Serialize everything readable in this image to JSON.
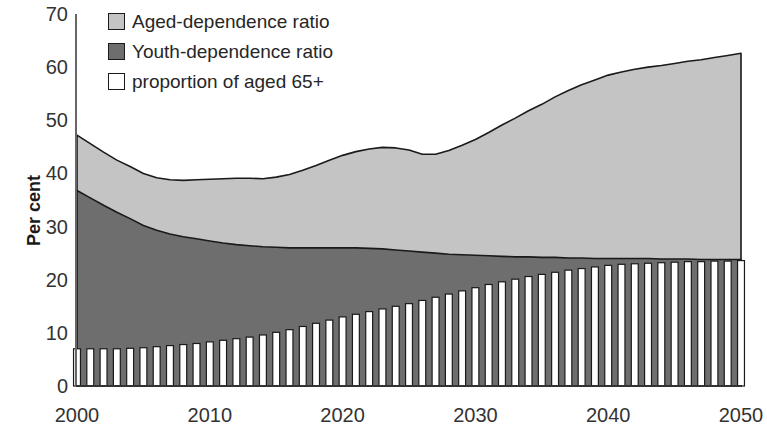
{
  "chart_data": {
    "type": "area",
    "title": "",
    "xlabel": "",
    "ylabel": "Per cent",
    "xlim": [
      2000,
      2050
    ],
    "ylim": [
      0,
      70
    ],
    "yticks": [
      70,
      60,
      50,
      40,
      30,
      20,
      10,
      0
    ],
    "xticks": [
      2000,
      2010,
      2020,
      2030,
      2040,
      2050
    ],
    "grid": false,
    "legend_position": "top-left",
    "stacked": true,
    "colors": {
      "aged_dependence": "#c4c4c4",
      "youth_dependence": "#6e6e6e",
      "proportion_aged_65plus": "#ffffff",
      "outline": "#1a1a1a",
      "axis": "#555555"
    },
    "x": [
      2000,
      2001,
      2002,
      2003,
      2004,
      2005,
      2006,
      2007,
      2008,
      2009,
      2010,
      2011,
      2012,
      2013,
      2014,
      2015,
      2016,
      2017,
      2018,
      2019,
      2020,
      2021,
      2022,
      2023,
      2024,
      2025,
      2026,
      2027,
      2028,
      2029,
      2030,
      2031,
      2032,
      2033,
      2034,
      2035,
      2036,
      2037,
      2038,
      2039,
      2040,
      2041,
      2042,
      2043,
      2044,
      2045,
      2046,
      2047,
      2048,
      2049,
      2050
    ],
    "series": [
      {
        "name": "Youth-dependence ratio",
        "values": [
          36.8,
          35.4,
          34.0,
          32.7,
          31.5,
          30.2,
          29.3,
          28.6,
          28.1,
          27.7,
          27.3,
          26.9,
          26.6,
          26.4,
          26.2,
          26.1,
          26.0,
          26.0,
          26.0,
          26.0,
          26.0,
          26.0,
          25.9,
          25.8,
          25.6,
          25.4,
          25.2,
          25.0,
          24.8,
          24.7,
          24.6,
          24.5,
          24.4,
          24.3,
          24.3,
          24.2,
          24.2,
          24.1,
          24.1,
          24.0,
          24.0,
          24.0,
          24.0,
          24.0,
          23.9,
          23.9,
          23.9,
          23.8,
          23.8,
          23.8,
          23.8
        ]
      },
      {
        "name": "Aged-dependence ratio",
        "values": [
          10.4,
          10.2,
          10.0,
          9.8,
          9.8,
          9.8,
          9.9,
          10.2,
          10.6,
          11.1,
          11.6,
          12.1,
          12.5,
          12.7,
          12.8,
          13.2,
          13.8,
          14.6,
          15.5,
          16.5,
          17.4,
          18.1,
          18.7,
          19.1,
          19.2,
          19.0,
          18.4,
          18.6,
          19.5,
          20.6,
          21.8,
          23.2,
          24.7,
          26.1,
          27.5,
          28.8,
          30.2,
          31.5,
          32.6,
          33.6,
          34.5,
          35.1,
          35.6,
          36.0,
          36.4,
          36.8,
          37.2,
          37.6,
          38.0,
          38.4,
          38.8
        ]
      }
    ],
    "total_dependence_ratio": [
      47.2,
      45.6,
      44.0,
      42.5,
      41.3,
      40.0,
      39.2,
      38.8,
      38.7,
      38.8,
      38.9,
      39.0,
      39.1,
      39.1,
      39.0,
      39.3,
      39.8,
      40.6,
      41.5,
      42.5,
      43.4,
      44.1,
      44.6,
      44.9,
      44.8,
      44.4,
      43.6,
      43.6,
      44.3,
      45.3,
      46.4,
      47.7,
      49.1,
      50.4,
      51.8,
      53.0,
      54.4,
      55.6,
      56.7,
      57.6,
      58.5,
      59.1,
      59.6,
      60.0,
      60.3,
      60.7,
      61.1,
      61.4,
      61.8,
      62.2,
      62.6
    ],
    "bars": {
      "name": "proportion of aged 65+",
      "values": [
        7.0,
        7.0,
        7.0,
        7.0,
        7.1,
        7.2,
        7.4,
        7.6,
        7.8,
        8.0,
        8.3,
        8.6,
        8.9,
        9.2,
        9.6,
        10.1,
        10.6,
        11.2,
        11.8,
        12.4,
        13.0,
        13.5,
        14.0,
        14.5,
        15.0,
        15.5,
        16.1,
        16.7,
        17.3,
        17.9,
        18.5,
        19.1,
        19.6,
        20.1,
        20.6,
        21.0,
        21.4,
        21.8,
        22.1,
        22.4,
        22.7,
        22.9,
        23.0,
        23.1,
        23.2,
        23.3,
        23.4,
        23.4,
        23.5,
        23.5,
        23.6
      ]
    }
  },
  "legend": {
    "items": [
      {
        "label": "Aged-dependence ratio",
        "color": "#c4c4c4"
      },
      {
        "label": "Youth-dependence ratio",
        "color": "#6e6e6e"
      },
      {
        "label": "proportion of aged 65+",
        "color": "#ffffff"
      }
    ]
  },
  "axes": {
    "y_title": "Per cent",
    "y_labels": [
      "70",
      "60",
      "50",
      "40",
      "30",
      "20",
      "10",
      "0"
    ],
    "x_labels": [
      "2000",
      "2010",
      "2020",
      "2030",
      "2040",
      "2050"
    ]
  }
}
